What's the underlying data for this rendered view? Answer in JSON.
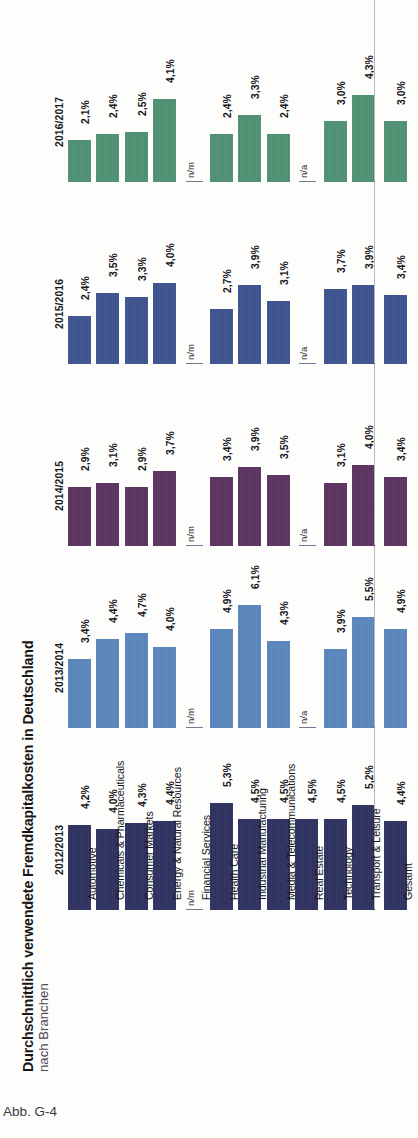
{
  "figure": {
    "title": "Durchschnittlich verwendete Fremdkapitalkosten in Deutschland",
    "subtitle": "nach Branchen",
    "caption": "Abb. G-4"
  },
  "chart_data": {
    "type": "bar",
    "title": "Durchschnittlich verwendete Fremdkapitalkosten in Deutschland",
    "subtitle": "nach Branchen",
    "xlabel": "",
    "ylabel": "",
    "orientation": "vertical-grouped-by-year-panels",
    "grid": false,
    "legend": "row-labels-left",
    "ylim": [
      0,
      6.5
    ],
    "value_suffix": "%",
    "decimal_separator": ",",
    "missing_markers": [
      "n/m",
      "n/a"
    ],
    "categories": [
      "Automotive",
      "Chemicals & Pharmaceuticals",
      "Consumer Markets",
      "Energy & Natural Resources",
      "Financial Services",
      "Health Care",
      "Industrial Manufacturing",
      "Media & Telecommunications",
      "Real Estate",
      "Technology",
      "Transport & Leisure"
    ],
    "total_category": "Gesamt",
    "series": [
      {
        "name": "2016/2017",
        "color": "#4f9173",
        "values": [
          2.1,
          2.4,
          2.5,
          4.1,
          null,
          2.4,
          3.3,
          2.4,
          null,
          3.0,
          4.3
        ],
        "labels": [
          "2,1%",
          "2,4%",
          "2,5%",
          "4,1%",
          "n/m",
          "2,4%",
          "3,3%",
          "2,4%",
          "n/a",
          "3,0%",
          "4,3%"
        ],
        "total_value": 3.0,
        "total_label": "3,0%"
      },
      {
        "name": "2015/2016",
        "color": "#3e5490",
        "values": [
          2.4,
          3.5,
          3.3,
          4.0,
          null,
          2.7,
          3.9,
          3.1,
          null,
          3.7,
          3.9
        ],
        "labels": [
          "2,4%",
          "3,5%",
          "3,3%",
          "4,0%",
          "n/m",
          "2,7%",
          "3,9%",
          "3,1%",
          "n/a",
          "3,7%",
          "3,9%"
        ],
        "total_value": 3.4,
        "total_label": "3,4%"
      },
      {
        "name": "2014/2015",
        "color": "#5b3360",
        "values": [
          2.9,
          3.1,
          2.9,
          3.7,
          null,
          3.4,
          3.9,
          3.5,
          null,
          3.1,
          4.0
        ],
        "labels": [
          "2,9%",
          "3,1%",
          "2,9%",
          "3,7%",
          "n/m",
          "3,4%",
          "3,9%",
          "3,5%",
          "n/a",
          "3,1%",
          "4,0%"
        ],
        "total_value": 3.4,
        "total_label": "3,4%"
      },
      {
        "name": "2013/2014",
        "color": "#5b87bd",
        "values": [
          3.4,
          4.4,
          4.7,
          4.0,
          null,
          4.9,
          6.1,
          4.3,
          null,
          3.9,
          5.5
        ],
        "labels": [
          "3,4%",
          "4,4%",
          "4,7%",
          "4,0%",
          "n/m",
          "4,9%",
          "6,1%",
          "4,3%",
          "n/a",
          "3,9%",
          "5,5%"
        ],
        "total_value": 4.9,
        "total_label": "4,9%"
      },
      {
        "name": "2012/2013",
        "color": "#2e3160",
        "values": [
          4.2,
          4.0,
          4.3,
          4.4,
          null,
          5.3,
          4.5,
          4.5,
          4.5,
          4.5,
          5.2
        ],
        "labels": [
          "4,2%",
          "4,0%",
          "4,3%",
          "4,4%",
          "n/m",
          "5,3%",
          "4,5%",
          "4,5%",
          "4,5%",
          "4,5%",
          "5,2%"
        ],
        "total_value": 4.4,
        "total_label": "4,4%"
      }
    ]
  }
}
